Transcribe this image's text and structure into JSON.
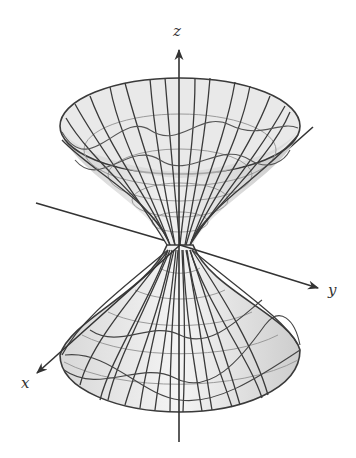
{
  "figure": {
    "title": "",
    "surface": "hyperboloid of one sheet",
    "axes": {
      "x_label": "x",
      "y_label": "y",
      "z_label": "z"
    },
    "colors": {
      "surface_fill": "#d9d9d9",
      "surface_fill_light": "#f2f2f2",
      "mesh_line": "#3a3a3a",
      "mesh_line_light": "#9a9a9a",
      "axis_line": "#333333",
      "background": "#ffffff"
    }
  }
}
